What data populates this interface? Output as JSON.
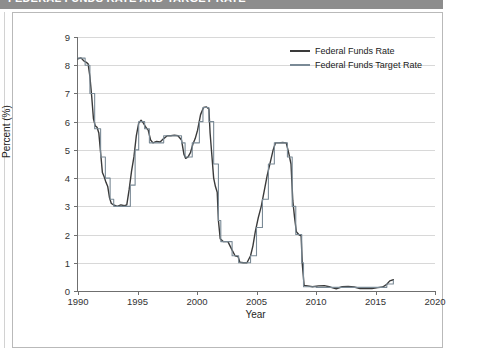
{
  "header": {
    "title": "FEDERAL FUNDS RATE AND TARGET RATE"
  },
  "axes": {
    "y_label": "Percent (%)",
    "x_label": "Year",
    "y_ticks": [
      "0",
      "1",
      "2",
      "3",
      "4",
      "5",
      "6",
      "7",
      "8",
      "9"
    ],
    "x_ticks": [
      "1990",
      "1995",
      "2000",
      "2005",
      "2010",
      "2015",
      "2020"
    ]
  },
  "legend": {
    "items": [
      {
        "label": "Federal Funds Rate",
        "color": "#3a3a3a"
      },
      {
        "label": "Federal Funds Target Rate",
        "color": "#7a8a96"
      }
    ]
  },
  "chart_data": {
    "type": "line",
    "title": "Federal Funds Rate and Target Rate",
    "xlabel": "Year",
    "ylabel": "Percent (%)",
    "xlim": [
      1990,
      2020
    ],
    "ylim": [
      0,
      9
    ],
    "grid": "horizontal",
    "legend_position": "top-right",
    "series": [
      {
        "name": "Federal Funds Rate",
        "color": "#3a3a3a",
        "points": [
          [
            1990.0,
            8.23
          ],
          [
            1990.25,
            8.26
          ],
          [
            1990.5,
            8.15
          ],
          [
            1990.7,
            8.1
          ],
          [
            1990.85,
            8.05
          ],
          [
            1991.0,
            7.6
          ],
          [
            1991.15,
            6.9
          ],
          [
            1991.3,
            6.1
          ],
          [
            1991.45,
            5.85
          ],
          [
            1991.6,
            5.8
          ],
          [
            1991.75,
            5.6
          ],
          [
            1991.9,
            4.9
          ],
          [
            1992.05,
            4.2
          ],
          [
            1992.2,
            4.05
          ],
          [
            1992.35,
            3.85
          ],
          [
            1992.5,
            3.7
          ],
          [
            1992.65,
            3.3
          ],
          [
            1992.8,
            3.1
          ],
          [
            1993.0,
            3.05
          ],
          [
            1993.3,
            3.0
          ],
          [
            1993.6,
            3.05
          ],
          [
            1993.9,
            3.02
          ],
          [
            1994.1,
            3.05
          ],
          [
            1994.3,
            3.6
          ],
          [
            1994.5,
            4.25
          ],
          [
            1994.7,
            4.75
          ],
          [
            1994.9,
            5.5
          ],
          [
            1995.1,
            5.95
          ],
          [
            1995.3,
            6.05
          ],
          [
            1995.5,
            5.95
          ],
          [
            1995.7,
            5.8
          ],
          [
            1995.9,
            5.7
          ],
          [
            1996.1,
            5.35
          ],
          [
            1996.3,
            5.25
          ],
          [
            1996.6,
            5.3
          ],
          [
            1996.9,
            5.28
          ],
          [
            1997.2,
            5.4
          ],
          [
            1997.5,
            5.5
          ],
          [
            1997.8,
            5.5
          ],
          [
            1998.1,
            5.52
          ],
          [
            1998.4,
            5.5
          ],
          [
            1998.7,
            5.35
          ],
          [
            1998.9,
            4.85
          ],
          [
            1999.05,
            4.7
          ],
          [
            1999.25,
            4.75
          ],
          [
            1999.45,
            4.9
          ],
          [
            1999.65,
            5.2
          ],
          [
            1999.85,
            5.4
          ],
          [
            2000.05,
            5.7
          ],
          [
            2000.3,
            6.25
          ],
          [
            2000.55,
            6.5
          ],
          [
            2000.8,
            6.52
          ],
          [
            2001.0,
            6.45
          ],
          [
            2001.1,
            5.6
          ],
          [
            2001.25,
            4.8
          ],
          [
            2001.4,
            4.0
          ],
          [
            2001.55,
            3.7
          ],
          [
            2001.7,
            3.5
          ],
          [
            2001.8,
            2.5
          ],
          [
            2001.95,
            1.85
          ],
          [
            2002.2,
            1.75
          ],
          [
            2002.6,
            1.75
          ],
          [
            2002.95,
            1.45
          ],
          [
            2003.2,
            1.25
          ],
          [
            2003.45,
            1.22
          ],
          [
            2003.6,
            1.02
          ],
          [
            2003.9,
            1.0
          ],
          [
            2004.2,
            1.0
          ],
          [
            2004.5,
            1.25
          ],
          [
            2004.7,
            1.6
          ],
          [
            2004.9,
            2.1
          ],
          [
            2005.15,
            2.6
          ],
          [
            2005.4,
            3.0
          ],
          [
            2005.65,
            3.55
          ],
          [
            2005.9,
            4.1
          ],
          [
            2006.15,
            4.55
          ],
          [
            2006.4,
            5.0
          ],
          [
            2006.6,
            5.25
          ],
          [
            2006.9,
            5.25
          ],
          [
            2007.2,
            5.26
          ],
          [
            2007.5,
            5.25
          ],
          [
            2007.7,
            4.9
          ],
          [
            2007.9,
            4.5
          ],
          [
            2008.05,
            3.2
          ],
          [
            2008.2,
            2.6
          ],
          [
            2008.35,
            2.1
          ],
          [
            2008.55,
            2.0
          ],
          [
            2008.75,
            1.95
          ],
          [
            2008.85,
            0.95
          ],
          [
            2009.0,
            0.2
          ],
          [
            2009.3,
            0.18
          ],
          [
            2009.7,
            0.15
          ],
          [
            2010.2,
            0.18
          ],
          [
            2010.7,
            0.19
          ],
          [
            2011.2,
            0.14
          ],
          [
            2011.7,
            0.08
          ],
          [
            2012.2,
            0.15
          ],
          [
            2012.7,
            0.16
          ],
          [
            2013.2,
            0.14
          ],
          [
            2013.7,
            0.09
          ],
          [
            2014.2,
            0.09
          ],
          [
            2014.7,
            0.09
          ],
          [
            2015.2,
            0.12
          ],
          [
            2015.6,
            0.14
          ],
          [
            2015.95,
            0.24
          ],
          [
            2016.2,
            0.36
          ],
          [
            2016.5,
            0.4
          ]
        ]
      },
      {
        "name": "Federal Funds Target Rate",
        "color": "#7a8a96",
        "points": [
          [
            1990.0,
            8.25
          ],
          [
            1990.6,
            8.0
          ],
          [
            1991.0,
            7.0
          ],
          [
            1991.4,
            5.75
          ],
          [
            1991.9,
            4.75
          ],
          [
            1992.3,
            4.0
          ],
          [
            1992.7,
            3.25
          ],
          [
            1993.0,
            3.0
          ],
          [
            1994.0,
            3.0
          ],
          [
            1994.4,
            3.75
          ],
          [
            1994.8,
            5.0
          ],
          [
            1995.1,
            6.0
          ],
          [
            1995.6,
            5.75
          ],
          [
            1996.0,
            5.25
          ],
          [
            1997.2,
            5.5
          ],
          [
            1998.7,
            5.25
          ],
          [
            1999.0,
            4.75
          ],
          [
            1999.6,
            5.25
          ],
          [
            2000.2,
            6.0
          ],
          [
            2000.5,
            6.5
          ],
          [
            2001.0,
            6.0
          ],
          [
            2001.4,
            4.5
          ],
          [
            2001.8,
            2.5
          ],
          [
            2002.0,
            1.75
          ],
          [
            2002.95,
            1.25
          ],
          [
            2003.5,
            1.0
          ],
          [
            2004.5,
            1.25
          ],
          [
            2005.0,
            2.25
          ],
          [
            2005.5,
            3.25
          ],
          [
            2006.0,
            4.5
          ],
          [
            2006.5,
            5.25
          ],
          [
            2007.6,
            4.75
          ],
          [
            2008.0,
            3.0
          ],
          [
            2008.3,
            2.0
          ],
          [
            2008.8,
            1.0
          ],
          [
            2008.95,
            0.15
          ],
          [
            2010.0,
            0.13
          ],
          [
            2011.0,
            0.13
          ],
          [
            2012.0,
            0.13
          ],
          [
            2013.0,
            0.13
          ],
          [
            2014.0,
            0.13
          ],
          [
            2015.0,
            0.13
          ],
          [
            2015.95,
            0.25
          ],
          [
            2016.5,
            0.38
          ]
        ]
      }
    ]
  }
}
